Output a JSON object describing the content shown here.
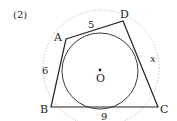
{
  "problem_label": "(2)",
  "vertices": {
    "A": "A",
    "B": "B",
    "C": "C",
    "D": "D"
  },
  "center": "O",
  "sides": {
    "AD": "5",
    "AB": "6",
    "BC": "9",
    "DC": "x"
  },
  "colors": {
    "line": "#222222",
    "dotted": "#aaaaaa"
  }
}
